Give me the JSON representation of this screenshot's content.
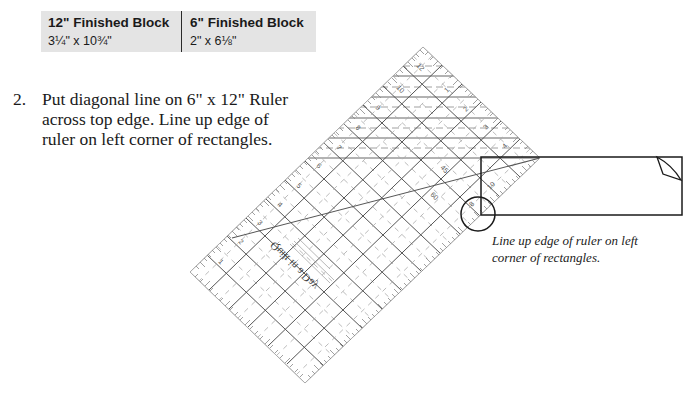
{
  "size_table": {
    "columns": [
      {
        "header": "12\" Finished Block",
        "value": "3¼\" x 10¾\""
      },
      {
        "header": "6\" Finished Block",
        "value": "2\" x 6⅛\""
      }
    ]
  },
  "step": {
    "number": "2.",
    "lines": [
      "Put diagonal line on 6\" x 12\" Ruler",
      "across top edge. Line up edge of",
      "ruler on left corner of rectangles."
    ]
  },
  "illustration": {
    "ruler": {
      "name": "6\" x 12\" Ruler",
      "logo_text": "Quilt in a Day",
      "corners": {
        "top": [
          423,
          47
        ],
        "right": [
          540,
          158
        ],
        "bottom": [
          305,
          383
        ],
        "left": [
          190,
          272
        ]
      }
    },
    "rectangle": {
      "x": 481,
      "y": 157,
      "width": 201,
      "height": 58
    },
    "highlight_circle": {
      "cx": 478,
      "cy": 214,
      "r": 17
    },
    "colors": {
      "ruler_line": "#555555",
      "ruler_dash": "#9a9a9a",
      "tick": "#777777",
      "outline": "#1a1a1a"
    }
  },
  "caption": {
    "lines": [
      "Line up edge of ruler on left",
      "corner of rectangles."
    ]
  }
}
